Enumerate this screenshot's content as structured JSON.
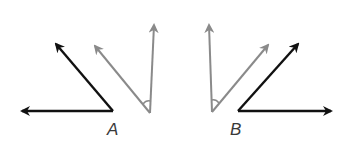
{
  "diagram": {
    "colors": {
      "black_ray": "#111111",
      "gray_ray": "#8a8a8a",
      "label": "#3a3a3a",
      "background": "#ffffff"
    },
    "labels": {
      "A": "A",
      "B": "B"
    },
    "angles": [
      {
        "name": "angle-A-black",
        "vertex": [
          113,
          111
        ],
        "ray1_tip": [
          20,
          111
        ],
        "ray2_tip": [
          54,
          42
        ],
        "color": "black"
      },
      {
        "name": "angle-A-gray",
        "vertex": [
          150,
          113
        ],
        "ray1_tip": [
          154,
          23
        ],
        "ray2_tip": [
          93,
          44
        ],
        "color": "gray",
        "arc_marked": true
      },
      {
        "name": "angle-B-gray",
        "vertex": [
          212,
          112
        ],
        "ray1_tip": [
          209,
          23
        ],
        "ray2_tip": [
          270,
          43
        ],
        "color": "gray",
        "arc_marked": true
      },
      {
        "name": "angle-B-black",
        "vertex": [
          238,
          111
        ],
        "ray1_tip": [
          333,
          111
        ],
        "ray2_tip": [
          300,
          42
        ],
        "color": "black"
      }
    ]
  }
}
